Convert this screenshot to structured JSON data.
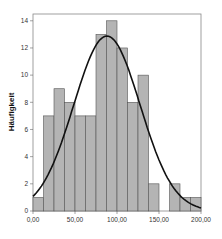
{
  "chart_data": {
    "type": "bar",
    "subtype": "histogram",
    "title": "",
    "xlabel": "",
    "ylabel": "Häufigkeit",
    "bin_width": 12.5,
    "bin_edges": [
      0,
      12.5,
      25,
      37.5,
      50,
      62.5,
      75,
      87.5,
      100,
      112.5,
      125,
      137.5,
      150,
      162.5,
      175,
      187.5,
      200
    ],
    "values": [
      1,
      7,
      9,
      8,
      7,
      7,
      13,
      14,
      12,
      8,
      10,
      2,
      0,
      2,
      1,
      1
    ],
    "xlim": [
      0,
      200
    ],
    "ylim": [
      0,
      14.5
    ],
    "x_ticks": [
      "0,00",
      "50,00",
      "100,00",
      "150,00",
      "200,00"
    ],
    "x_tick_values": [
      0,
      50,
      100,
      150,
      200
    ],
    "y_ticks": [
      0,
      2,
      4,
      6,
      8,
      10,
      12,
      14
    ],
    "overlay": {
      "type": "normal_curve",
      "mean": 88,
      "sd": 39.5,
      "n": 102
    },
    "bar_color": "#b4b4b4",
    "bar_edge_color": "#555555",
    "curve_color": "#111111",
    "grid": false,
    "legend": null
  }
}
